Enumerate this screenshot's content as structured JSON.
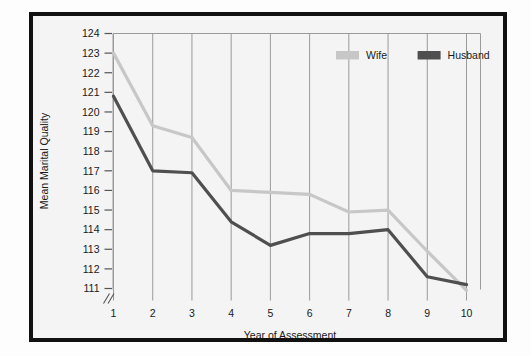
{
  "chart_data": {
    "type": "line",
    "title": "",
    "xlabel": "Year of Assessment",
    "ylabel": "Mean Marital Quality",
    "x": [
      1,
      2,
      3,
      4,
      5,
      6,
      7,
      8,
      9,
      10
    ],
    "categories": [
      "1",
      "2",
      "3",
      "4",
      "5",
      "6",
      "7",
      "8",
      "9",
      "10"
    ],
    "xtick_labels": [
      "1",
      "2",
      "3",
      "4",
      "5",
      "6",
      "7",
      "8",
      "9",
      "10"
    ],
    "ytick_labels": [
      "111",
      "112",
      "113",
      "114",
      "115",
      "116",
      "117",
      "118",
      "119",
      "120",
      "121",
      "122",
      "123",
      "124"
    ],
    "ytick_values": [
      111,
      112,
      113,
      114,
      115,
      116,
      117,
      118,
      119,
      120,
      121,
      122,
      123,
      124
    ],
    "ylim": [
      111,
      124
    ],
    "xlim": [
      1,
      10
    ],
    "axis_break": true,
    "axis_break_symbol": "//",
    "grid": "vertical",
    "legend_position": "top-right",
    "series": [
      {
        "name": "Wife",
        "color": "#c7c7c7",
        "values": [
          123.0,
          119.3,
          118.7,
          116.0,
          115.9,
          115.8,
          114.9,
          115.0,
          112.9,
          110.9
        ]
      },
      {
        "name": "Husband",
        "color": "#4f4f4f",
        "values": [
          120.8,
          117.0,
          116.9,
          114.4,
          113.2,
          113.8,
          113.8,
          114.0,
          111.6,
          111.2
        ]
      }
    ]
  },
  "legend": {
    "entries": [
      {
        "label": "Wife",
        "color": "#c7c7c7"
      },
      {
        "label": "Husband",
        "color": "#4f4f4f"
      }
    ]
  },
  "axes": {
    "x_title": "Year of Assessment",
    "y_title": "Mean Marital Quality"
  },
  "colors": {
    "frame": "#111111",
    "plot_background": "#f4f4f4",
    "gridline": "#9a9a9a",
    "axis": "#555555",
    "wife": "#c7c7c7",
    "husband": "#4f4f4f"
  }
}
